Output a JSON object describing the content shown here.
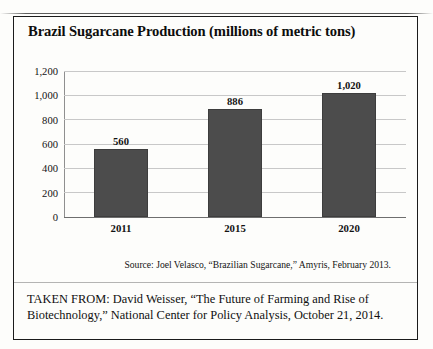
{
  "figure": {
    "title": "Brazil Sugarcane Production (millions of metric tons)",
    "source_note": "Source: Joel Velasco, “Brazilian Sugarcane,” Amyris, February 2013.",
    "attribution_line1": "TAKEN FROM: David Weisser, “The Future of Farming and Rise of",
    "attribution_line2": "Biotechnology,” National Center for Policy Analysis, October 21, 2014.",
    "bar_color": "#4c4c4c",
    "gridline_color": "#c8c8c8",
    "frame_color": "#1b1b1b"
  },
  "chart_data": {
    "type": "bar",
    "title": "Brazil Sugarcane Production (millions of metric tons)",
    "xlabel": "",
    "ylabel": "",
    "categories": [
      "2011",
      "2015",
      "2020"
    ],
    "values": [
      560,
      886,
      1020
    ],
    "value_labels": [
      "560",
      "886",
      "1,020"
    ],
    "ylim": [
      0,
      1200
    ],
    "yticks": [
      0,
      200,
      400,
      600,
      800,
      1000,
      1200
    ],
    "ytick_labels": [
      "0",
      "200",
      "400",
      "600",
      "800",
      "1,000",
      "1,200"
    ],
    "grid": true,
    "legend": "none",
    "series": [
      {
        "name": "Sugarcane production",
        "values": [
          560,
          886,
          1020
        ]
      }
    ]
  }
}
